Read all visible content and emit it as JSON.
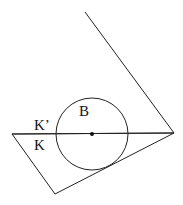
{
  "diagram": {
    "colors": {
      "stroke": "#222222",
      "text": "#111111",
      "background": "#ffffff"
    },
    "polygon_upper": {
      "points": "85,12 174,133 12,134"
    },
    "polygon_lower": {
      "points": "12,134 55,194 174,133"
    },
    "chord": {
      "x1": 12,
      "y1": 134,
      "x2": 174,
      "y2": 133
    },
    "circle": {
      "cx": 92,
      "cy": 134,
      "r": 36
    },
    "center_point": {
      "cx": 92,
      "cy": 134,
      "r": 2
    },
    "labels": {
      "B": "B",
      "K_prime": "K’",
      "K": "K"
    }
  }
}
